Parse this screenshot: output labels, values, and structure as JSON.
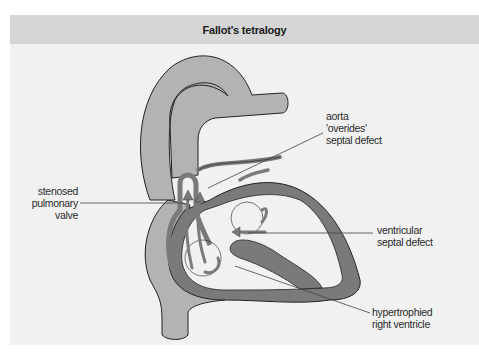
{
  "figure": {
    "title": "Fallot's tetralogy",
    "colors": {
      "background": "#f1f1f1",
      "header": "#d6d6d6",
      "vessel_light": "#b3b3b3",
      "muscle_dark": "#7a7a7a",
      "outline": "#222222",
      "leader_line": "#444444"
    },
    "labels": {
      "aorta_overrides": [
        "aorta",
        "'overides'",
        "septal defect"
      ],
      "stenosed_pulmonary_valve": [
        "stenosed",
        "pulmonary",
        "valve"
      ],
      "ventricular_septal_defect": [
        "ventricular",
        "septal defect"
      ],
      "hypertrophied_right_ventricle": [
        "hypertrophied",
        "right ventricle"
      ]
    }
  }
}
